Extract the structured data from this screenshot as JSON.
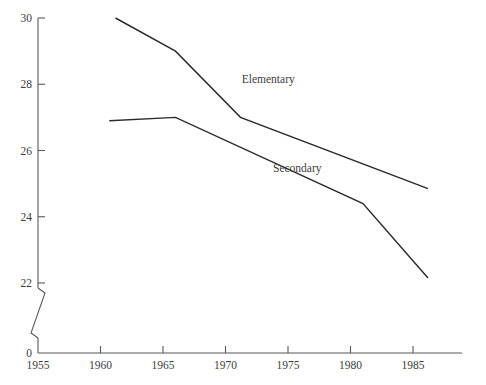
{
  "chart_data": {
    "type": "line",
    "title": "",
    "subtitle": "",
    "xlabel": "",
    "ylabel": "",
    "xlim": [
      1955,
      1987.5
    ],
    "ylim": [
      22,
      30
    ],
    "y_axis_broken": true,
    "y_break_baseline_label": "0",
    "grid": false,
    "legend_position": "inline-annotations",
    "x_ticks": [
      "1955",
      "1960",
      "1965",
      "1970",
      "1975",
      "1980",
      "1985"
    ],
    "x_tick_values": [
      1955,
      1960,
      1965,
      1970,
      1975,
      1980,
      1985
    ],
    "y_ticks": [
      "30",
      "28",
      "26",
      "24",
      "22"
    ],
    "y_tick_values": [
      30,
      28,
      26,
      24,
      22
    ],
    "series": [
      {
        "name": "Elementary",
        "label": "Elementary",
        "color": "#2b2b2b",
        "label_x": 1971.3,
        "label_y": 28.05,
        "x": [
          1961.2,
          1966.0,
          1971.2,
          1986.2
        ],
        "values": [
          30.0,
          29.0,
          27.0,
          24.85
        ]
      },
      {
        "name": "Secondary",
        "label": "Secondary",
        "color": "#2b2b2b",
        "label_x": 1973.8,
        "label_y": 25.35,
        "x": [
          1960.7,
          1966.0,
          1981.0,
          1986.2
        ],
        "values": [
          26.9,
          27.0,
          24.4,
          22.15
        ]
      }
    ]
  }
}
